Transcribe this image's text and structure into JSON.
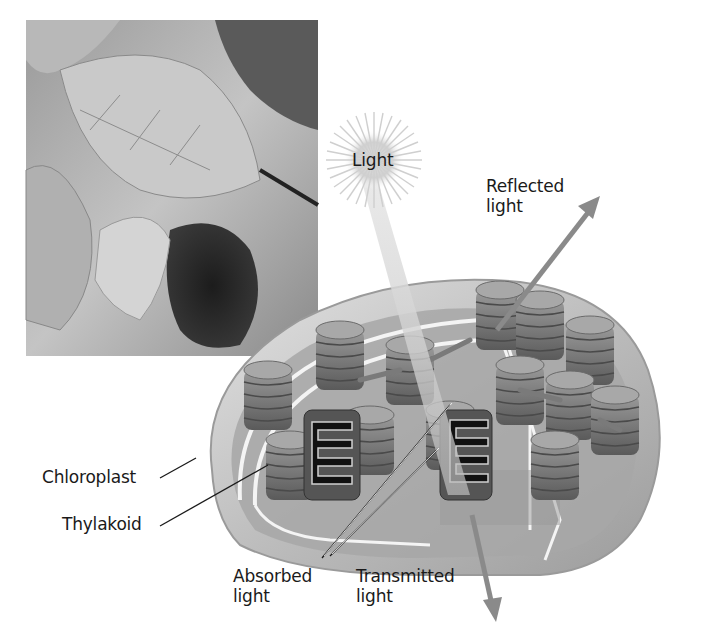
{
  "figure": {
    "type": "diagram",
    "photo": {
      "description": "grayscale photograph of leaves (backlit)"
    },
    "labels": {
      "light": "Light",
      "reflected": {
        "line1": "Reflected",
        "line2": "light"
      },
      "chloroplast": "Chloroplast",
      "thylakoid": "Thylakoid",
      "absorbed": {
        "line1": "Absorbed",
        "line2": "light"
      },
      "transmitted": {
        "line1": "Transmitted",
        "line2": "light"
      }
    },
    "colors": {
      "background": "#ffffff",
      "arrow": "#8a8a8a",
      "outer_membrane": "#b8b8b8",
      "stroma": "#a9a9a9",
      "granum": "#7a7a7a",
      "granum_dark": "#1e1e1e",
      "light_beam": "#d9d9d9",
      "text": "#1a1a1a"
    },
    "icons": {
      "light_source": "sunburst-icon"
    }
  }
}
